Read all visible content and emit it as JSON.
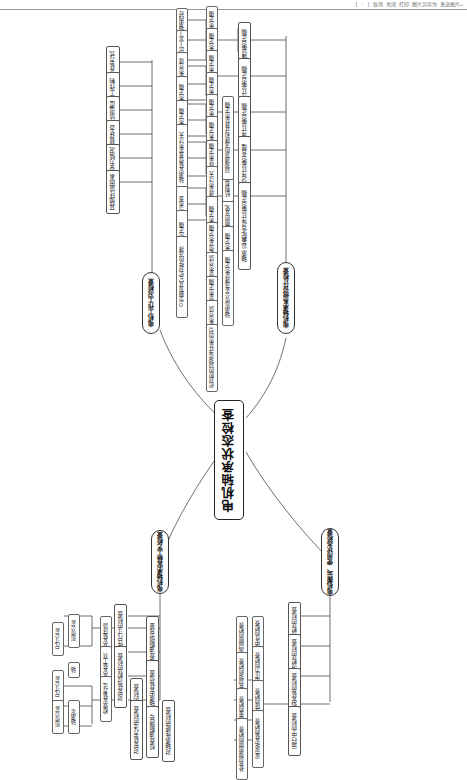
{
  "page": {
    "header_note": "[ - ]  取消  关闭  打印  图片另存为  发送图片…",
    "width": 467,
    "height": 763,
    "orientation": "rotated-90",
    "diagram_type": "mindmap"
  },
  "root": {
    "label": "电机轴承状态检查"
  },
  "branches": [
    {
      "id": "b1",
      "label": "电机工作工况检查"
    },
    {
      "id": "b2",
      "label": "电机轴承系统设计检查"
    },
    {
      "id": "b3",
      "label": "电机轴承安装工艺检查"
    },
    {
      "id": "b4",
      "label": "电机搬运、使用状态检查"
    }
  ],
  "b1_children": [
    {
      "label": "安装方式"
    },
    {
      "label": "工作制"
    },
    {
      "label": "环境温度"
    },
    {
      "label": "负载状态"
    },
    {
      "label": "轴承受力情况"
    },
    {
      "label": "其他环境因素"
    }
  ],
  "b2_children": [
    {
      "label": "轴承选择是否正确"
    },
    {
      "label": "轴承系统设计是否正确"
    },
    {
      "label": "轴承安装结构设计是否正确"
    },
    {
      "label": "轴承密封结构设计是否合理"
    },
    {
      "label": "轴承公差配合设计是否正确"
    }
  ],
  "b2_sub": [
    {
      "label": "轴承大小选择是否正确"
    },
    {
      "label": "轴承类型选择是否正确"
    },
    {
      "label": "轴承游隙选择是否正确"
    },
    {
      "label": "轴承精度选择是否正确"
    },
    {
      "label": "轴承润滑选择是否正确"
    },
    {
      "label": "轴承内外圈配合是否正确"
    },
    {
      "label": "轴承寿命计算校核轴承选择是否正确"
    },
    {
      "label": "最小负荷计算校核轴承选择是否过大"
    },
    {
      "label": "轴承承载能力校核是否正确"
    },
    {
      "label": "轴承定位是否正确"
    },
    {
      "label": "轴承受力方向的选择"
    },
    {
      "label": "轴承游隙的变化"
    },
    {
      "label": "结构布置中的轴承配合是否合理"
    },
    {
      "label": "润滑通道的选择和计算是否正确"
    },
    {
      "label": "轴承尺寸公差选择是否正确"
    },
    {
      "label": "轴承形位公差选择是否正确"
    },
    {
      "label": "密封形式的选择是否合适"
    },
    {
      "label": "密封件的结构设计是否正确"
    },
    {
      "label": "密封圈材料选择是否合适"
    },
    {
      "label": "密封腔的润滑设计是否均匀"
    }
  ],
  "b2_leaf": [
    {
      "label": "轴承内径"
    },
    {
      "label": "长径比(宽)"
    },
    {
      "label": "额定载荷及选择是否合理"
    },
    {
      "label": "游隙状态选择是否正确"
    },
    {
      "label": "保持架结构选择是否正确"
    },
    {
      "label": "轴承安装位置是否过大"
    },
    {
      "label": "润滑形式的选择与布置"
    },
    {
      "label": "润滑油脂的选择是否正确"
    },
    {
      "label": "O型圈及其它密封件的选择"
    }
  ],
  "b3_children": [
    {
      "label": "对工件尺寸的检查"
    },
    {
      "label": "对安装过程的检查"
    },
    {
      "label": "对安装环境的检查"
    },
    {
      "label": "对安装方法的检查"
    },
    {
      "label": "检查油脂填充量"
    },
    {
      "label": "检查轴承安装位置"
    },
    {
      "label": "检查油脂牌号"
    },
    {
      "label": "对轴承性能的检查"
    }
  ],
  "b3_sub": [
    {
      "label": "尺寸公差"
    },
    {
      "label": "形位公差"
    },
    {
      "label": "轴"
    },
    {
      "label": "轴承室"
    },
    {
      "label": "尺寸公差"
    },
    {
      "label": "形位公差"
    },
    {
      "label": "检查安装环境"
    },
    {
      "label": "检查安装工具"
    },
    {
      "label": "检查安装方法"
    }
  ],
  "b4_children": [
    {
      "label": "运输过程的检查"
    },
    {
      "label": "储存过程的检查"
    },
    {
      "label": "电机安装的检查"
    },
    {
      "label": "运行中的检查"
    }
  ],
  "b4_sub": [
    {
      "label": "对中性的检查"
    },
    {
      "label": "受电压力的检查"
    },
    {
      "label": "联轴器连接的检查"
    },
    {
      "label": "皮带轮安装的检查"
    },
    {
      "label": "轴承间隙的检查"
    },
    {
      "label": "补充润滑的检查"
    },
    {
      "label": "补充润滑量的检查"
    },
    {
      "label": "补充润滑周期的检查"
    }
  ]
}
